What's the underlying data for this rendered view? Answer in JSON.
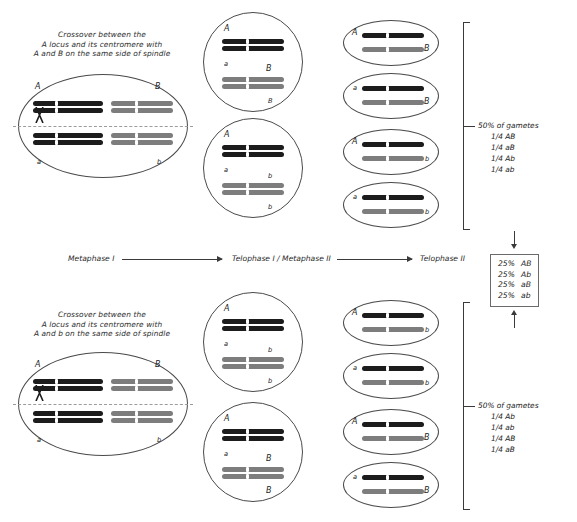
{
  "diagram": {
    "colors": {
      "dark_chromosome": "#1c1c1c",
      "gray_chromosome": "#7d7d7d",
      "cell_outline": "#4a4a4a",
      "equator_dash": "#9b9b9b",
      "text": "#232323"
    }
  },
  "stages": {
    "metaphase_i": "Metaphase I",
    "telophase_i_metaphase_ii": "Telophase I / Metaphase II",
    "telophase_ii": "Telophase II"
  },
  "top": {
    "caption_line1": "Crossover between the",
    "caption_line2": "A locus and its centromere with",
    "caption_line3": "A and B on the same side of spindle",
    "metaphase_cell": {
      "top_left_label": "A",
      "top_right_label": "B",
      "bottom_left_label": "a",
      "bottom_right_label": "b"
    },
    "telophase_i_cells": [
      {
        "upper_label": "A",
        "lower_label": "a",
        "second_upper_label": "B",
        "second_lower_label": "B"
      },
      {
        "upper_label": "A",
        "lower_label": "a",
        "second_upper_label": "b",
        "second_lower_label": "b"
      }
    ],
    "telophase_ii_cells": [
      {
        "dark_label": "A",
        "gray_label": "B"
      },
      {
        "dark_label": "a",
        "gray_label": "B"
      },
      {
        "dark_label": "A",
        "gray_label": "b"
      },
      {
        "dark_label": "a",
        "gray_label": "b"
      }
    ],
    "gametes": {
      "heading": "50% of gametes",
      "items": [
        "1/4 AB",
        "1/4 aB",
        "1/4 Ab",
        "1/4 ab"
      ]
    }
  },
  "bottom": {
    "caption_line1": "Crossover between the",
    "caption_line2": "A locus and its centromere with",
    "caption_line3": "A and b on the same side of spindle",
    "metaphase_cell": {
      "top_left_label": "A",
      "top_right_label": "B",
      "bottom_left_label": "a",
      "bottom_right_label": "b"
    },
    "telophase_i_cells": [
      {
        "upper_label": "A",
        "lower_label": "a",
        "second_upper_label": "b",
        "second_lower_label": "b"
      },
      {
        "upper_label": "A",
        "lower_label": "a",
        "second_upper_label": "B",
        "second_lower_label": "B"
      }
    ],
    "telophase_ii_cells": [
      {
        "dark_label": "A",
        "gray_label": "b"
      },
      {
        "dark_label": "a",
        "gray_label": "b"
      },
      {
        "dark_label": "A",
        "gray_label": "B"
      },
      {
        "dark_label": "a",
        "gray_label": "B"
      }
    ],
    "gametes": {
      "heading": "50% of gametes",
      "items": [
        "1/4 Ab",
        "1/4 ab",
        "1/4 AB",
        "1/4 aB"
      ]
    }
  },
  "summary": {
    "rows": [
      {
        "percent": "25%",
        "genotype": "AB"
      },
      {
        "percent": "25%",
        "genotype": "Ab"
      },
      {
        "percent": "25%",
        "genotype": "aB"
      },
      {
        "percent": "25%",
        "genotype": "ab"
      }
    ]
  }
}
